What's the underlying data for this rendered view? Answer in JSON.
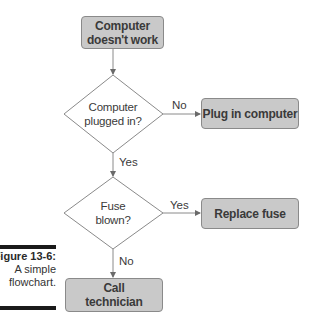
{
  "figure": {
    "number_label": "Figure 13-6:",
    "caption_line1": "A simple",
    "caption_line2": "flowchart."
  },
  "flowchart": {
    "nodes": {
      "start": {
        "type": "process",
        "line1": "Computer",
        "line2": "doesn't work"
      },
      "decision_plugged": {
        "type": "decision",
        "line1": "Computer",
        "line2": "plugged in?"
      },
      "plug_in": {
        "type": "process",
        "label": "Plug in computer"
      },
      "decision_fuse": {
        "type": "decision",
        "line1": "Fuse",
        "line2": "blown?"
      },
      "replace_fuse": {
        "type": "process",
        "label": "Replace fuse"
      },
      "call_tech": {
        "type": "process",
        "line1": "Call",
        "line2": "technician"
      }
    },
    "edges": [
      {
        "from": "start",
        "to": "decision_plugged",
        "label": ""
      },
      {
        "from": "decision_plugged",
        "to": "plug_in",
        "label": "No"
      },
      {
        "from": "decision_plugged",
        "to": "decision_fuse",
        "label": "Yes"
      },
      {
        "from": "decision_fuse",
        "to": "replace_fuse",
        "label": "Yes"
      },
      {
        "from": "decision_fuse",
        "to": "call_tech",
        "label": "No"
      }
    ]
  },
  "colors": {
    "box_fill": "#c9c9c9",
    "box_border": "#8a8a8a",
    "line": "#8a8a8a",
    "text": "#3a3a3a",
    "caption_bar": "#1a1a1a"
  }
}
